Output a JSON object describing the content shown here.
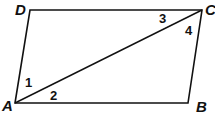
{
  "diagram": {
    "type": "parallelogram-with-diagonal",
    "vertices": {
      "A": {
        "label": "A",
        "x": 15,
        "y": 103
      },
      "B": {
        "label": "B",
        "x": 188,
        "y": 103
      },
      "C": {
        "label": "C",
        "x": 202,
        "y": 10
      },
      "D": {
        "label": "D",
        "x": 30,
        "y": 10
      }
    },
    "diagonal": {
      "from": "A",
      "to": "C"
    },
    "angles": [
      {
        "label": "1",
        "vertex": "A",
        "between": "AD-AC"
      },
      {
        "label": "2",
        "vertex": "A",
        "between": "AC-AB"
      },
      {
        "label": "3",
        "vertex": "C",
        "between": "CD-CA"
      },
      {
        "label": "4",
        "vertex": "C",
        "between": "CA-CB"
      }
    ],
    "stroke_color": "#111111"
  }
}
